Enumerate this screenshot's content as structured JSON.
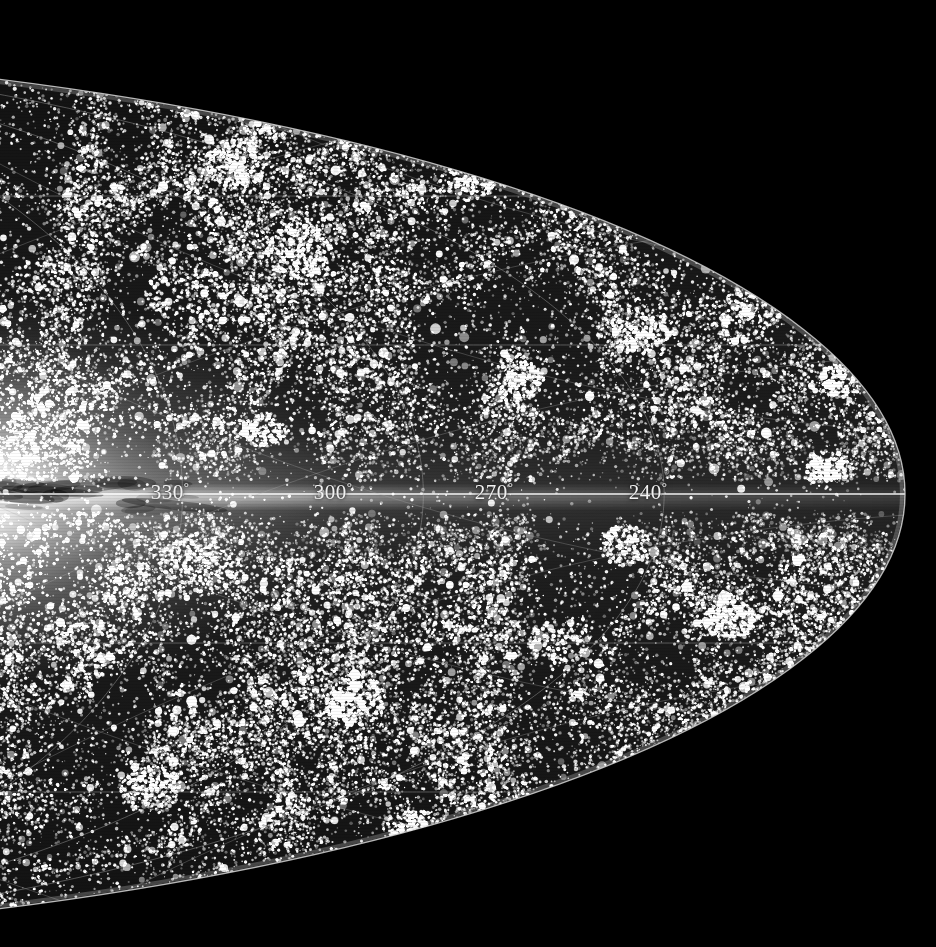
{
  "figure": {
    "projection": "aitoff",
    "background_color": "#000000",
    "outline_color": "#c8c8c8",
    "grid_color": "#9a9a9a",
    "star_color": "#ffffff",
    "galactic_plane_color": "#ffffff"
  },
  "labels": [
    {
      "name": "longitude-label-330",
      "text": "330",
      "degree": "°",
      "x": 170,
      "y": 492
    },
    {
      "name": "longitude-label-300",
      "text": "300",
      "degree": "°",
      "x": 333,
      "y": 492
    },
    {
      "name": "longitude-label-270",
      "text": "270",
      "degree": "°",
      "x": 494,
      "y": 492
    },
    {
      "name": "longitude-label-240",
      "text": "240",
      "degree": "°",
      "x": 648,
      "y": 492
    }
  ],
  "chart_data": {
    "type": "scatter",
    "xlabel": "Galactic longitude",
    "ylabel": "Galactic latitude",
    "xlim": [
      240,
      360
    ],
    "ylim": [
      -90,
      90
    ],
    "grid": true,
    "legend_position": "none",
    "longitude_ticks": [
      "330°",
      "300°",
      "270°",
      "240°"
    ],
    "longitude_tick_values": [
      330,
      300,
      270,
      240
    ],
    "latitude_gridlines": [
      -60,
      -30,
      0,
      30,
      60
    ],
    "meridian_spacing_deg": 30,
    "parallel_spacing_deg": 30,
    "point_count": 42000,
    "annotations": [
      {
        "label": "galactic-center-glow",
        "x_deg": 360,
        "y_deg": 0
      },
      {
        "label": "galactic-plane",
        "x_deg": 300,
        "y_deg": 0
      }
    ]
  },
  "geometry": {
    "ellipse_center_x": -540,
    "ellipse_center_y": 494,
    "ellipse_radius_x": 1445,
    "ellipse_radius_y": 447,
    "equator_y": 497,
    "right_vertex_x": 905
  }
}
